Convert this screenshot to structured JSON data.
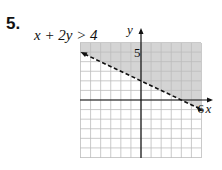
{
  "problem": {
    "number": "5.",
    "inequality": "x + 2y > 4"
  },
  "chart_data": {
    "type": "line",
    "title": "x + 2y > 4",
    "xlabel": "x",
    "ylabel": "y",
    "xlim": [
      -6,
      6
    ],
    "ylim": [
      -6,
      6
    ],
    "grid": true,
    "tick_labels": {
      "x": [
        "6"
      ],
      "y": [
        "5"
      ]
    },
    "boundary": {
      "equation": "x + 2y = 4",
      "style": "dashed",
      "points": [
        [
          -6,
          5
        ],
        [
          6,
          -1
        ]
      ],
      "slope": -0.5,
      "y_intercept": 2
    },
    "shaded_region": "above boundary line",
    "colors": {
      "shade": "#d4d4d4",
      "grid": "#bdbdbd",
      "line": "#111111"
    }
  },
  "labels": {
    "y_axis": "y",
    "x_axis": "x",
    "y_tick": "5",
    "x_tick": "6"
  }
}
